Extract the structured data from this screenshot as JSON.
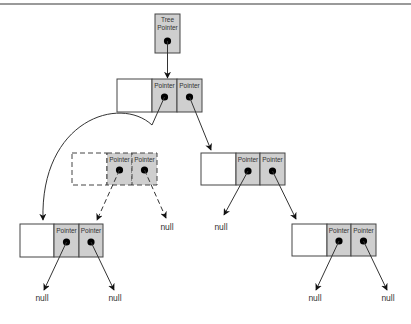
{
  "diagram": {
    "type": "binary-tree-pointer-diagram",
    "tree_pointer": {
      "label_line1": "Tree",
      "label_line2": "Pointer"
    },
    "pointer_label": "Pointer",
    "null_label": "null",
    "colors": {
      "pointer_cell": "#cfcfcf",
      "data_cell": "#ffffff",
      "stroke": "#444444",
      "dot": "#000000"
    },
    "nodes": [
      {
        "id": "root",
        "style": "solid",
        "left": "Pointer",
        "right": "Pointer"
      },
      {
        "id": "removed-node",
        "style": "dashed",
        "left": "Pointer",
        "right": "Pointer"
      },
      {
        "id": "right-child",
        "style": "solid",
        "left": "Pointer",
        "right": "Pointer"
      },
      {
        "id": "left-grandchild",
        "style": "solid",
        "left": "Pointer",
        "right": "Pointer"
      },
      {
        "id": "right-grandchild",
        "style": "solid",
        "left": "Pointer",
        "right": "Pointer"
      }
    ],
    "edges": [
      {
        "from": "tree-pointer",
        "to": "root"
      },
      {
        "from": "root.left",
        "to": "left-grandchild",
        "style": "curved"
      },
      {
        "from": "root.right",
        "to": "right-child"
      },
      {
        "from": "removed-node.left",
        "to": "left-grandchild",
        "style": "dashed"
      },
      {
        "from": "removed-node.right",
        "to": "null",
        "style": "dashed"
      },
      {
        "from": "right-child.left",
        "to": "null"
      },
      {
        "from": "right-child.right",
        "to": "right-grandchild"
      },
      {
        "from": "left-grandchild.left",
        "to": "null"
      },
      {
        "from": "left-grandchild.right",
        "to": "null"
      },
      {
        "from": "right-grandchild.left",
        "to": "null"
      },
      {
        "from": "right-grandchild.right",
        "to": "null"
      }
    ]
  }
}
